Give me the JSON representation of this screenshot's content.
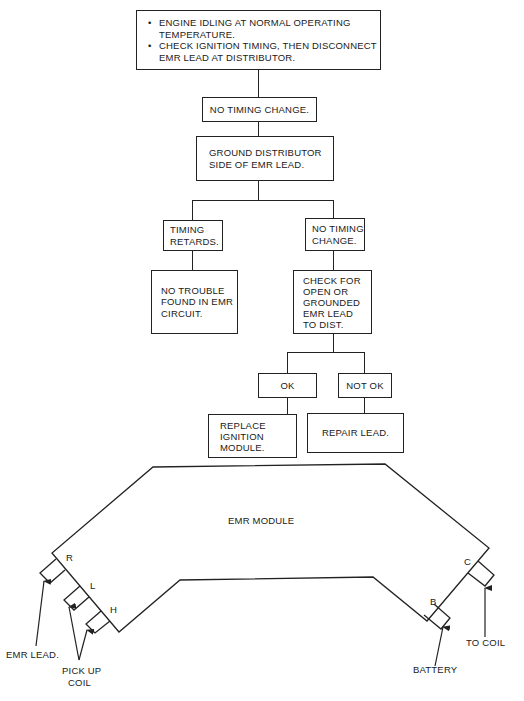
{
  "flowchart": {
    "start": {
      "bullets": [
        "ENGINE IDLING AT NORMAL OPERATING TEMPERATURE.",
        "CHECK IGNITION TIMING; THEN DISCONNECT EMR LEAD AT DISTRIBUTOR."
      ],
      "bullet_lines": [
        [
          "ENGINE IDLING AT NORMAL OPERATING",
          "TEMPERATURE."
        ],
        [
          "CHECK IGNITION TIMING, THEN DISCONNECT",
          "EMR LEAD AT DISTRIBUTOR."
        ]
      ]
    },
    "step1": {
      "text": "NO TIMING CHANGE."
    },
    "step2": {
      "lines": [
        "GROUND DISTRIBUTOR",
        "SIDE OF EMR LEAD."
      ]
    },
    "branch_left": {
      "result": {
        "lines": [
          "TIMING",
          "RETARDS."
        ]
      },
      "action": {
        "lines": [
          "NO TROUBLE",
          "FOUND IN EMR",
          "CIRCUIT."
        ]
      }
    },
    "branch_right": {
      "result": {
        "lines": [
          "NO TIMING",
          "CHANGE."
        ]
      },
      "action": {
        "lines": [
          "CHECK FOR",
          "OPEN OR",
          "GROUNDED",
          "EMR LEAD",
          "TO DIST."
        ]
      },
      "sub_left": {
        "result": {
          "text": "OK"
        },
        "action": {
          "lines": [
            "REPLACE",
            "IGNITION",
            "MODULE."
          ]
        }
      },
      "sub_right": {
        "result": {
          "text": "NOT OK"
        },
        "action": {
          "text": "REPAIR LEAD."
        }
      }
    }
  },
  "module_diagram": {
    "title": "EMR MODULE",
    "terminals": [
      {
        "id": "R",
        "label": "R"
      },
      {
        "id": "L",
        "label": "L"
      },
      {
        "id": "H",
        "label": "H"
      },
      {
        "id": "B",
        "label": "B"
      },
      {
        "id": "C",
        "label": "C"
      }
    ],
    "callouts": {
      "emr_lead": "EMR LEAD.",
      "pick_up_coil": [
        "PICK UP",
        "COIL"
      ],
      "battery": "BATTERY",
      "to_coil": "TO COIL"
    }
  }
}
